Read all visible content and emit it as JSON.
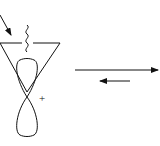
{
  "diagram": {
    "type": "chemistry-orbital-equilibrium",
    "charge_label": "+",
    "colors": {
      "stroke": "#111111",
      "background": "#ffffff"
    },
    "elements": {
      "triangle": "cyclopropyl-ring",
      "orbital": "p-orbital-two-lobes",
      "wavy_bond": "substituent-bond",
      "incoming_arrow": "attack-arrow",
      "equilibrium": {
        "forward": "long-right-arrow",
        "reverse": "short-left-arrow"
      }
    }
  }
}
